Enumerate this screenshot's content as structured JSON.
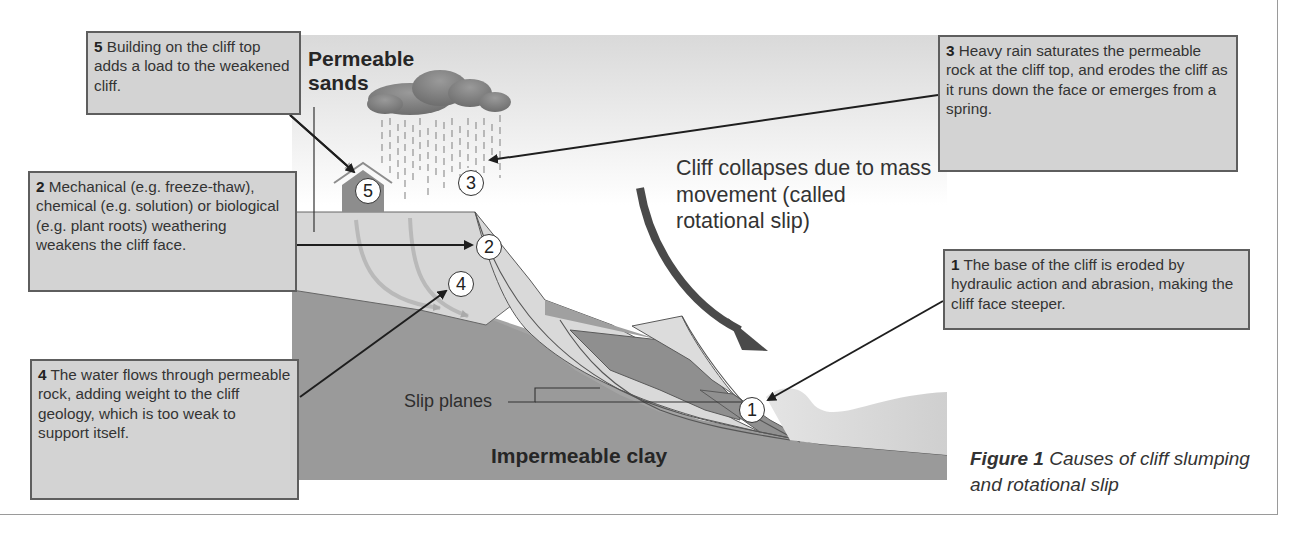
{
  "figure": {
    "caption_title": "Figure 1",
    "caption_text": "Causes of cliff slumping and rotational slip"
  },
  "labels": {
    "permeable_sands": "Permeable sands",
    "impermeable_clay": "Impermeable clay",
    "slip_planes": "Slip planes",
    "collapse_note": "Cliff collapses due to mass movement (called rotational slip)"
  },
  "markers": [
    "1",
    "2",
    "3",
    "4",
    "5"
  ],
  "callouts": [
    {
      "num": "1",
      "text": "The base of the cliff is eroded by hydraulic action and abrasion, making the cliff face steeper."
    },
    {
      "num": "2",
      "text": "Mechanical (e.g. freeze-thaw), chemical (e.g. solution) or biological (e.g. plant roots) weathering weakens the cliff face."
    },
    {
      "num": "3",
      "text": "Heavy rain saturates the permeable rock at the cliff top, and erodes the cliff as it runs down the face or emerges from a spring."
    },
    {
      "num": "4",
      "text": "The water flows through permeable rock, adding weight to the cliff geology, which is too weak to support itself."
    },
    {
      "num": "5",
      "text": "Building on the cliff top adds a load to the weakened cliff."
    }
  ],
  "colors": {
    "callout_bg": "#d3d3d3",
    "callout_border": "#5e5e5e",
    "sand": "#d6d6d6",
    "clay": "#9c9c9c",
    "slump_dark": "#8e8e8e",
    "arrow": "#4a4a4a",
    "sea": "#dcdcdc"
  }
}
